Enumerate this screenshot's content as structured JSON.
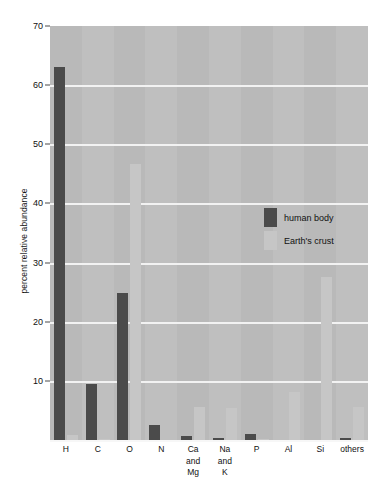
{
  "chart_data": {
    "type": "bar",
    "title": "",
    "xlabel": "",
    "ylabel": "percent relative abundance",
    "ylim": [
      0,
      70
    ],
    "yticks": [
      10,
      20,
      30,
      40,
      50,
      60,
      70
    ],
    "grid": true,
    "legend_position": "inside-upper-center",
    "categories": [
      "H",
      "C",
      "O",
      "N",
      "Ca\nand\nMg",
      "Na\nand\nK",
      "P",
      "Al",
      "Si",
      "others"
    ],
    "category_lines": [
      [
        "H"
      ],
      [
        "C"
      ],
      [
        "O"
      ],
      [
        "N"
      ],
      [
        "Ca",
        "and",
        "Mg"
      ],
      [
        "Na",
        "and",
        "K"
      ],
      [
        "P"
      ],
      [
        "Al"
      ],
      [
        "Si"
      ],
      [
        "others"
      ]
    ],
    "series": [
      {
        "name": "human body",
        "color": "#4b4b4b",
        "values": [
          63.0,
          9.5,
          24.9,
          2.6,
          0.6,
          0.4,
          1.0,
          0.0,
          0.0,
          0.3
        ]
      },
      {
        "name": "Earth's crust",
        "color": "#c6c6c6",
        "values": [
          0.9,
          0.1,
          46.6,
          0.0,
          5.6,
          5.4,
          0.1,
          8.1,
          27.6,
          5.5
        ]
      }
    ]
  },
  "colors": {
    "plot_background": "#b9b9b9",
    "band_background": "#bfbfbf",
    "gridline": "#f2f2f2",
    "page_background": "#ffffff",
    "text": "#111111"
  }
}
